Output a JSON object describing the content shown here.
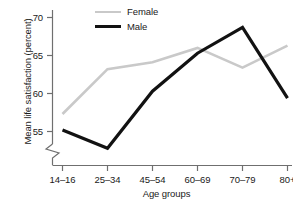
{
  "chart_data": {
    "type": "line",
    "title": "",
    "xlabel": "Age groups",
    "ylabel": "Mean life satisfaction (percent)",
    "categories": [
      "14–16",
      "25–34",
      "45–54",
      "60–69",
      "70–79",
      "80+"
    ],
    "yticks": [
      55,
      60,
      65,
      70
    ],
    "ylim": [
      51.5,
      71.5
    ],
    "y_axis_break": true,
    "y_axis_break_note": "zigzag break on y-axis below the 55 tick",
    "grid": false,
    "legend_position": "top-left inside plot",
    "series": [
      {
        "name": "Female",
        "color": "#c9c9c9",
        "line_width": 2.6,
        "values": [
          57.3,
          63.2,
          64.1,
          66.0,
          63.4,
          66.3
        ]
      },
      {
        "name": "Male",
        "color": "#121212",
        "line_width": 3.2,
        "values": [
          55.2,
          52.8,
          60.3,
          65.3,
          68.7,
          59.4
        ]
      }
    ]
  },
  "axis": {
    "ytick_labels": [
      "70",
      "65",
      "60",
      "55"
    ],
    "xtick_labels": [
      "14–16",
      "25–34",
      "45–54",
      "60–69",
      "70–79",
      "80+"
    ],
    "x_title": "Age groups",
    "y_title": "Mean life satisfaction (percent)"
  },
  "legend": {
    "items": [
      {
        "label": "Female",
        "color": "#c9c9c9"
      },
      {
        "label": "Male",
        "color": "#121212"
      }
    ]
  },
  "colors": {
    "axis": "#6f6f6f",
    "text": "#1a1a1a",
    "female": "#c9c9c9",
    "male": "#121212",
    "background": "#ffffff"
  }
}
